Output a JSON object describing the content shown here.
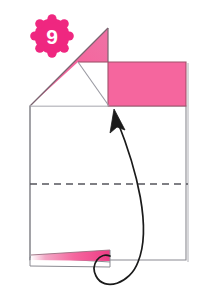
{
  "figure": {
    "kind": "origami-fold-diagram",
    "step_number": "9",
    "background_color": "#ffffff"
  },
  "badge": {
    "label": "9",
    "shape": "scalloped-circle",
    "fill_color": "#EF2780",
    "text_color": "#ffffff",
    "center_x": 52,
    "center_y": 36,
    "radius": 20
  },
  "palette": {
    "paper_front": "#F5669E",
    "paper_front_shade": "#EE4F90",
    "paper_back": "#ffffff",
    "edge_dark": "#6B6B73",
    "edge_light": "#B8B8BE",
    "edge_pink": "#E8528F",
    "crease_dash": "#55555C",
    "arrow_color": "#1A1A1A"
  },
  "shapes": {
    "main_body": {
      "name": "main-square-panel",
      "fill": "#ffffff",
      "points": "30,106 186,106 186,260 30,260"
    },
    "flap_triangle": {
      "name": "upper-left-pink-triangle",
      "fill": "#F5669E",
      "points": "108,28 108,62 78,62 30,106"
    },
    "flap_rectangle": {
      "name": "upper-right-pink-rectangle",
      "fill": "#F5669E",
      "points": "108,62 186,62 186,106 108,106"
    },
    "white_wedge": {
      "name": "white-triangle-under-flap",
      "fill": "#ffffff",
      "points": "78,62 108,62 108,106 30,106"
    },
    "bottom_sliver": {
      "name": "bottom-pink-sliver",
      "fill": "#F5669E",
      "points": "31,256 108,252 108,261 31,261"
    },
    "bottom_sliver_under": {
      "name": "bottom-white-sliver",
      "fill": "#ffffff",
      "points": "30,258 108,261 108,266 30,265"
    }
  },
  "lines": {
    "crease_dashed": {
      "name": "valley-fold-crease",
      "style": "dashed",
      "x1": 30,
      "y1": 184,
      "x2": 187,
      "y2": 184
    },
    "panel_top": {
      "name": "panel-top-edge",
      "x1": 30,
      "y1": 106,
      "x2": 108,
      "y2": 106
    },
    "diagonal_inner": {
      "name": "inner-diagonal-crease",
      "x1": 78,
      "y1": 62,
      "x2": 108,
      "y2": 106
    },
    "flap_top": {
      "name": "flap-top-edge",
      "x1": 78,
      "y1": 62,
      "x2": 108,
      "y2": 62
    },
    "right_vertical_outer": {
      "name": "right-outer-edge",
      "x1": 188,
      "y1": 62,
      "x2": 188,
      "y2": 262
    }
  },
  "arrow": {
    "name": "fold-direction-arrow",
    "description": "curved arrow looping from bottom edge up to the inner diagonal crease",
    "path": "M 116,118 C 135,180 150,235 131,270 C 120,290 98,288 96,272 C 94,258 104,254 108,258",
    "head_tip_x": 116,
    "head_tip_y": 110,
    "stroke_width": 1.6
  }
}
